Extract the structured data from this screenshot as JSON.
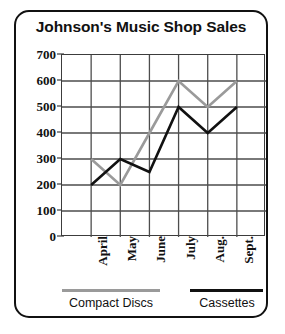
{
  "chart_data": {
    "type": "line",
    "title": "Johnson's Music Shop Sales",
    "xlabel": "",
    "ylabel": "",
    "categories": [
      "April",
      "May",
      "June",
      "July",
      "Aug.",
      "Sept."
    ],
    "ylim": [
      0,
      700
    ],
    "yticks": [
      0,
      100,
      200,
      300,
      400,
      500,
      600,
      700
    ],
    "ytick_labels": [
      "0",
      "100",
      "200",
      "300",
      "400",
      "500",
      "600",
      "700"
    ],
    "grid": true,
    "legend_position": "bottom",
    "series": [
      {
        "name": "Compact Discs",
        "color": "#9a9a9a",
        "values": [
          300,
          200,
          400,
          600,
          500,
          600
        ]
      },
      {
        "name": "Cassettes",
        "color": "#111111",
        "values": [
          200,
          300,
          250,
          500,
          400,
          500
        ]
      }
    ]
  },
  "legend": {
    "compact_discs_label": "Compact Discs",
    "cassettes_label": "Cassettes"
  },
  "colors": {
    "compact_discs": "#9a9a9a",
    "cassettes": "#111111",
    "grid": "#4d4d4d",
    "border": "#111111"
  }
}
